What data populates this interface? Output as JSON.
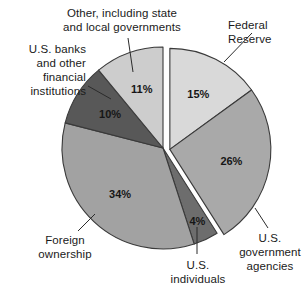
{
  "chart_data": {
    "type": "pie",
    "title": "",
    "subtitle": "",
    "xlabel": "",
    "ylabel": "",
    "legend_position": "none",
    "grid": false,
    "units": "percent",
    "categories": [
      "Federal Reserve",
      "U.S. government agencies",
      "U.S. individuals",
      "Foreign ownership",
      "U.S. banks and other financial institutions",
      "Other, including state and local governments"
    ],
    "values": [
      15,
      26,
      4,
      34,
      10,
      11
    ],
    "slices": [
      {
        "label": "Federal Reserve",
        "value": 15,
        "value_text": "15%",
        "color": "#d9d9d9",
        "exploded": true,
        "start_angle_deg": 0,
        "end_angle_deg": 54
      },
      {
        "label": "U.S. government agencies",
        "value": 26,
        "value_text": "26%",
        "color": "#a9a9a9",
        "exploded": true,
        "start_angle_deg": 54,
        "end_angle_deg": 147.6
      },
      {
        "label": "U.S. individuals",
        "value": 4,
        "value_text": "4%",
        "color": "#6d6d6d",
        "exploded": false,
        "start_angle_deg": 147.6,
        "end_angle_deg": 162
      },
      {
        "label": "Foreign ownership",
        "value": 34,
        "value_text": "34%",
        "color": "#a2a2a2",
        "exploded": false,
        "start_angle_deg": 162,
        "end_angle_deg": 284.4
      },
      {
        "label": "U.S. banks and other financial institutions",
        "value": 10,
        "value_text": "10%",
        "color": "#585858",
        "exploded": false,
        "start_angle_deg": 284.4,
        "end_angle_deg": 320.4
      },
      {
        "label": "Other, including state and local governments",
        "value": 11,
        "value_text": "11%",
        "color": "#cdcdcd",
        "exploded": false,
        "start_angle_deg": 320.4,
        "end_angle_deg": 360
      }
    ]
  },
  "labels": {
    "other": "Other, including state\nand local governments",
    "banks": "U.S. banks\nand other\nfinancial\ninstitutions",
    "federal_reserve": "Federal\nReserve",
    "government_agencies": "U.S.\ngovernment\nagencies",
    "individuals": "U.S.\nindividuals",
    "foreign": "Foreign\nownership"
  },
  "values": {
    "federal_reserve": "15%",
    "government_agencies": "26%",
    "individuals": "4%",
    "foreign": "34%",
    "banks": "10%",
    "other": "11%"
  },
  "colors": {
    "federal_reserve": "#d9d9d9",
    "government_agencies": "#a9a9a9",
    "individuals": "#6d6d6d",
    "foreign": "#a2a2a2",
    "banks": "#585858",
    "other": "#cdcdcd",
    "outline": "#3a3a3a",
    "text": "#1a1a1a",
    "background": "#ffffff"
  }
}
